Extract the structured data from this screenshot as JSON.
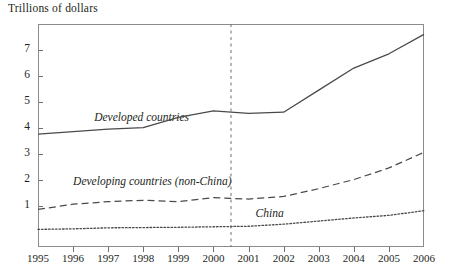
{
  "chart_data": {
    "type": "line",
    "title": "",
    "ylabel": "Trillions of dollars",
    "xlabel": "",
    "x": [
      1995,
      1996,
      1997,
      1998,
      1999,
      2000,
      2001,
      2002,
      2003,
      2004,
      2005,
      2006
    ],
    "xtick_labels": [
      "1995",
      "1996",
      "1997",
      "1998",
      "1999",
      "2000",
      "2001",
      "2002",
      "2003",
      "2004",
      "2005",
      "2006"
    ],
    "ytick_labels": [
      "1",
      "2",
      "3",
      "4",
      "5",
      "6",
      "7"
    ],
    "ytick_values": [
      1,
      2,
      3,
      4,
      5,
      6,
      7
    ],
    "ylim": [
      -0.6,
      8.0
    ],
    "xlim": [
      1995,
      2006
    ],
    "grid": false,
    "legend": "inline-annotations",
    "annotations": [
      {
        "text": "Developed countries",
        "x": 1996.6,
        "y": 4.35,
        "style": "italic"
      },
      {
        "text": "Developing countries (non-China)",
        "x": 1996.0,
        "y": 1.85,
        "style": "italic"
      },
      {
        "text": "China",
        "x": 2001.2,
        "y": 0.62,
        "style": "italic"
      }
    ],
    "reference_line": {
      "x": 2000.5,
      "style": "dashed",
      "orientation": "vertical"
    },
    "series": [
      {
        "name": "Developed countries",
        "style": "solid",
        "values": [
          3.75,
          3.85,
          3.95,
          4.0,
          4.4,
          4.65,
          4.55,
          4.6,
          5.45,
          6.3,
          6.85,
          7.6
        ]
      },
      {
        "name": "Developing countries (non-China)",
        "style": "dashed",
        "values": [
          0.85,
          1.05,
          1.15,
          1.2,
          1.15,
          1.3,
          1.25,
          1.35,
          1.65,
          2.0,
          2.45,
          3.05
        ]
      },
      {
        "name": "China",
        "style": "dotted",
        "values": [
          0.08,
          0.1,
          0.14,
          0.15,
          0.16,
          0.18,
          0.2,
          0.28,
          0.4,
          0.52,
          0.62,
          0.8
        ]
      }
    ]
  },
  "colors": {
    "axis": "#8b8b8b",
    "text": "#231f20",
    "series_developed": "#4a4a4a",
    "series_developing": "#4a4a4a",
    "series_china": "#4a4a4a"
  }
}
